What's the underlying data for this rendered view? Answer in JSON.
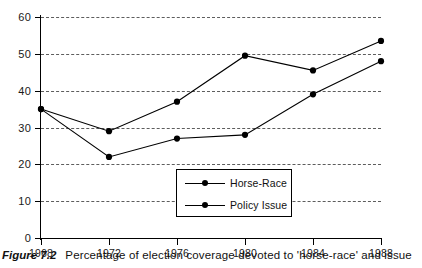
{
  "figure": {
    "label": "Figure 7.2",
    "caption": "Percentage of election coverage devoted to 'horse-race' and issue"
  },
  "legend": {
    "items": [
      {
        "name": "Horse-Race"
      },
      {
        "name": "Policy Issue"
      }
    ]
  },
  "chart_data": {
    "type": "line",
    "title": "",
    "subtitle": "",
    "xlabel": "",
    "ylabel": "",
    "x": [
      1968,
      1972,
      1976,
      1980,
      1984,
      1988
    ],
    "categories": [
      "1968",
      "1972",
      "1976",
      "1980",
      "1984",
      "1988"
    ],
    "series": [
      {
        "name": "Horse-Race",
        "values": [
          35,
          29,
          37,
          49.5,
          45.5,
          53.5
        ],
        "marker": "filled-circle",
        "line": "solid",
        "color": "#000000"
      },
      {
        "name": "Policy Issue",
        "values": [
          35,
          22,
          27,
          28,
          39,
          48
        ],
        "marker": "filled-circle",
        "line": "solid",
        "color": "#000000"
      }
    ],
    "xlim": [
      1968,
      1988
    ],
    "ylim": [
      0,
      60
    ],
    "yticks": [
      0,
      10,
      20,
      30,
      40,
      50,
      60
    ],
    "ytick_labels": [
      "0",
      "10",
      "20",
      "30",
      "40",
      "50",
      "60"
    ],
    "xticks": [
      1968,
      1972,
      1976,
      1980,
      1984,
      1988
    ],
    "xtick_labels": [
      "1968",
      "1972",
      "1976",
      "1980",
      "1984",
      "1988"
    ],
    "grid": "horizontal-dashed",
    "legend_position": "inside-bottom-center"
  }
}
